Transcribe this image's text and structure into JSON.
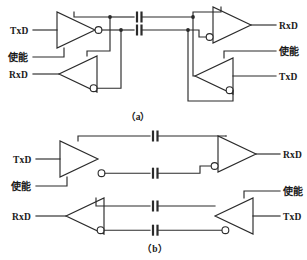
{
  "figure": {
    "type": "circuit-diagram",
    "background_color": "#ffffff",
    "line_color": "#2b2b2b"
  },
  "panels": [
    {
      "id": "a",
      "caption": "（a）",
      "topology": "shared-bus full-duplex with cross-coupled drivers and receivers",
      "labels": {
        "left_driver_in": "TxD",
        "left_driver_enable": "使能",
        "left_receiver_out": "RxD",
        "right_receiver_out": "RxD",
        "right_driver_enable": "使能",
        "right_driver_in": "TxD"
      },
      "components": [
        {
          "name": "left-driver",
          "kind": "buffer",
          "inverted_output": true,
          "direction": "right"
        },
        {
          "name": "left-receiver",
          "kind": "buffer",
          "inverted_output": true,
          "direction": "left"
        },
        {
          "name": "right-receiver",
          "kind": "buffer",
          "inverted_output": true,
          "direction": "right"
        },
        {
          "name": "right-driver",
          "kind": "buffer",
          "inverted_output": true,
          "direction": "left"
        },
        {
          "name": "coupling-capacitor-top",
          "kind": "capacitor"
        },
        {
          "name": "coupling-capacitor-bottom",
          "kind": "capacitor"
        }
      ],
      "junction_count": 4,
      "capacitor_count": 2
    },
    {
      "id": "b",
      "caption": "（b）",
      "topology": "two independent simplex channels, each capacitively coupled",
      "labels": {
        "upper_driver_in": "TxD",
        "upper_driver_enable": "使能",
        "upper_receiver_out": "RxD",
        "lower_receiver_out": "RxD",
        "lower_driver_enable": "使能",
        "lower_driver_in": "TxD"
      },
      "components": [
        {
          "name": "upper-driver",
          "kind": "buffer",
          "inverted_output": true,
          "direction": "right"
        },
        {
          "name": "upper-receiver",
          "kind": "buffer",
          "inverted_output": true,
          "direction": "right"
        },
        {
          "name": "lower-receiver",
          "kind": "buffer",
          "inverted_output": true,
          "direction": "left"
        },
        {
          "name": "lower-driver",
          "kind": "buffer",
          "inverted_output": true,
          "direction": "left"
        },
        {
          "name": "upper-capacitor-top",
          "kind": "capacitor"
        },
        {
          "name": "upper-capacitor-bottom",
          "kind": "capacitor"
        },
        {
          "name": "lower-capacitor-top",
          "kind": "capacitor"
        },
        {
          "name": "lower-capacitor-bottom",
          "kind": "capacitor"
        }
      ],
      "junction_count": 0,
      "capacitor_count": 4
    }
  ]
}
